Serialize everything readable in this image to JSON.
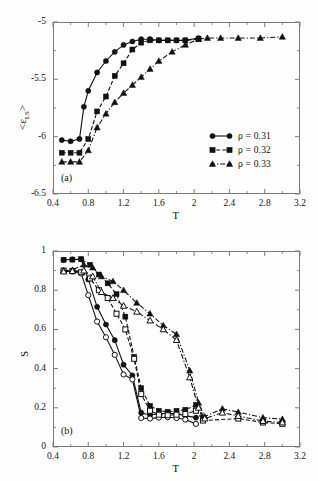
{
  "figure": {
    "background": "#fefefe",
    "axis_color": "#7d7d7d",
    "data_color": "#111111"
  },
  "panel_a": {
    "tag": "(a)",
    "ylabel_prefix": "<ε",
    "ylabel_sub": "LS",
    "ylabel_suffix": ">",
    "xlabel": "T",
    "legend": [
      {
        "label": "ρ = 0.31",
        "marker": "circle-filled",
        "line": "solid"
      },
      {
        "label": "ρ = 0.32",
        "marker": "square-filled",
        "line": "dashed"
      },
      {
        "label": "ρ = 0.33",
        "marker": "triangle-filled",
        "line": "dashdot"
      }
    ]
  },
  "panel_b": {
    "tag": "(b)",
    "ylabel": "S",
    "xlabel": "T"
  },
  "chart_data": [
    {
      "type": "line",
      "panel": "a",
      "title": "",
      "xlabel": "T",
      "ylabel": "<ε_LS>",
      "xlim": [
        0.4,
        3.2
      ],
      "ylim": [
        -6.5,
        -5.0
      ],
      "xticks": [
        0.4,
        0.8,
        1.2,
        1.6,
        2.0,
        2.4,
        2.8,
        3.2
      ],
      "xtick_labels": [
        "0.4",
        "0.8",
        "1.2",
        "1.6",
        "2",
        "2.4",
        "2.8",
        "3.2"
      ],
      "yticks": [
        -6.5,
        -6.0,
        -5.5,
        -5.0
      ],
      "ytick_labels": [
        "-6.5",
        "-6",
        "-5.5",
        "-5"
      ],
      "minor_ticks": true,
      "grid": false,
      "legend_position": "center-right",
      "series": [
        {
          "name": "ρ = 0.31",
          "marker": "circle-filled",
          "line": "solid",
          "x": [
            0.5,
            0.6,
            0.7,
            0.75,
            0.8,
            0.9,
            1.0,
            1.1,
            1.2,
            1.3,
            1.4,
            1.5,
            1.6,
            1.7,
            1.8,
            1.9,
            2.05
          ],
          "y": [
            -6.03,
            -6.04,
            -6.02,
            -5.74,
            -5.6,
            -5.44,
            -5.34,
            -5.26,
            -5.2,
            -5.17,
            -5.15,
            -5.15,
            -5.16,
            -5.16,
            -5.16,
            -5.16,
            -5.14
          ]
        },
        {
          "name": "ρ = 0.32",
          "marker": "square-filled",
          "line": "dashed",
          "x": [
            0.5,
            0.6,
            0.7,
            0.8,
            0.9,
            1.0,
            1.1,
            1.2,
            1.3,
            1.4,
            1.5,
            1.6,
            1.7,
            1.8,
            1.9,
            2.05
          ],
          "y": [
            -6.14,
            -6.14,
            -6.14,
            -6.02,
            -5.78,
            -5.65,
            -5.47,
            -5.36,
            -5.24,
            -5.18,
            -5.16,
            -5.16,
            -5.16,
            -5.16,
            -5.16,
            -5.15
          ]
        },
        {
          "name": "ρ = 0.33",
          "marker": "triangle-filled",
          "line": "dashdot",
          "x": [
            0.5,
            0.6,
            0.7,
            0.8,
            0.9,
            1.0,
            1.1,
            1.2,
            1.3,
            1.4,
            1.5,
            1.6,
            1.75,
            1.9,
            2.05,
            2.15,
            2.3,
            2.5,
            2.75,
            3.0
          ],
          "y": [
            -6.22,
            -6.22,
            -6.22,
            -6.12,
            -5.92,
            -5.8,
            -5.7,
            -5.62,
            -5.55,
            -5.48,
            -5.41,
            -5.34,
            -5.26,
            -5.2,
            -5.15,
            -5.14,
            -5.14,
            -5.14,
            -5.14,
            -5.13
          ]
        }
      ]
    },
    {
      "type": "line",
      "panel": "b",
      "title": "",
      "xlabel": "T",
      "ylabel": "S",
      "xlim": [
        0.4,
        3.2
      ],
      "ylim": [
        0.0,
        1.0
      ],
      "xticks": [
        0.4,
        0.8,
        1.2,
        1.6,
        2.0,
        2.4,
        2.8,
        3.2
      ],
      "xtick_labels": [
        "0.4",
        "0.8",
        "1.2",
        "1.6",
        "2",
        "2.4",
        "2.8",
        "3.2"
      ],
      "yticks": [
        0,
        0.2,
        0.4,
        0.6,
        0.8,
        1.0
      ],
      "ytick_labels": [
        "0",
        "0.2",
        "0.4",
        "0.6",
        "0.8",
        "1"
      ],
      "minor_ticks": true,
      "grid": false,
      "legend_position": "none",
      "series": [
        {
          "name": "ρ = 0.31 filled",
          "marker": "circle-filled",
          "line": "solid",
          "x": [
            0.52,
            0.62,
            0.72,
            0.8,
            0.9,
            1.0,
            1.1,
            1.2,
            1.3,
            1.4,
            1.5,
            1.6,
            1.7,
            1.8,
            1.9,
            2.02
          ],
          "y": [
            0.955,
            0.957,
            0.958,
            0.855,
            0.715,
            0.625,
            0.545,
            0.42,
            0.365,
            0.175,
            0.163,
            0.17,
            0.172,
            0.17,
            0.16,
            0.15
          ]
        },
        {
          "name": "ρ = 0.31 open",
          "marker": "circle-open",
          "line": "solid",
          "x": [
            0.52,
            0.62,
            0.72,
            0.8,
            0.9,
            1.0,
            1.1,
            1.2,
            1.3,
            1.4,
            1.5,
            1.6,
            1.7,
            1.8,
            1.9,
            2.02
          ],
          "y": [
            0.9,
            0.895,
            0.885,
            0.775,
            0.64,
            0.56,
            0.47,
            0.37,
            0.345,
            0.148,
            0.145,
            0.15,
            0.152,
            0.148,
            0.14,
            0.118
          ]
        },
        {
          "name": "ρ = 0.32 filled",
          "marker": "square-filled",
          "line": "dashed",
          "x": [
            0.52,
            0.62,
            0.72,
            0.82,
            0.92,
            1.02,
            1.12,
            1.22,
            1.32,
            1.4,
            1.5,
            1.6,
            1.7,
            1.8,
            1.9,
            2.02,
            2.1
          ],
          "y": [
            0.955,
            0.956,
            0.958,
            0.93,
            0.88,
            0.835,
            0.78,
            0.665,
            0.46,
            0.3,
            0.21,
            0.185,
            0.18,
            0.185,
            0.19,
            0.215,
            0.15
          ]
        },
        {
          "name": "ρ = 0.32 open",
          "marker": "square-open",
          "line": "dashed",
          "x": [
            0.52,
            0.62,
            0.72,
            0.82,
            0.92,
            1.02,
            1.12,
            1.22,
            1.32,
            1.4,
            1.5,
            1.6,
            1.7,
            1.8,
            1.9,
            2.02,
            2.1,
            2.5,
            2.78,
            3.0
          ],
          "y": [
            0.9,
            0.898,
            0.892,
            0.86,
            0.8,
            0.76,
            0.68,
            0.6,
            0.45,
            0.27,
            0.185,
            0.165,
            0.162,
            0.165,
            0.168,
            0.185,
            0.135,
            0.145,
            0.125,
            0.118
          ]
        },
        {
          "name": "ρ = 0.33 filled",
          "marker": "triangle-filled",
          "line": "dashdot",
          "x": [
            0.52,
            0.62,
            0.75,
            0.85,
            0.95,
            1.08,
            1.2,
            1.35,
            1.5,
            1.65,
            1.8,
            1.95,
            2.05,
            2.12,
            2.32,
            2.5,
            2.78,
            3.0
          ],
          "y": [
            0.9,
            0.903,
            0.93,
            0.915,
            0.87,
            0.845,
            0.8,
            0.735,
            0.68,
            0.62,
            0.575,
            0.39,
            0.225,
            0.155,
            0.195,
            0.178,
            0.15,
            0.142
          ]
        },
        {
          "name": "ρ = 0.33 open",
          "marker": "triangle-open",
          "line": "dashdot",
          "x": [
            0.52,
            0.62,
            0.75,
            0.85,
            0.95,
            1.08,
            1.2,
            1.35,
            1.5,
            1.65,
            1.8,
            1.95,
            2.05,
            2.12,
            2.32,
            2.5,
            2.78,
            3.0
          ],
          "y": [
            0.895,
            0.897,
            0.9,
            0.87,
            0.79,
            0.76,
            0.72,
            0.69,
            0.645,
            0.6,
            0.545,
            0.355,
            0.2,
            0.145,
            0.175,
            0.158,
            0.132,
            0.125
          ]
        }
      ]
    }
  ]
}
